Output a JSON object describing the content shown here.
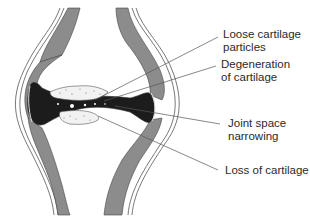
{
  "labels": [
    {
      "id": "loose-particles",
      "text": "Loose cartilage\nparticles",
      "x": 223,
      "y": 28
    },
    {
      "id": "degeneration",
      "text": "Degeneration\nof cartilage",
      "x": 221,
      "y": 58
    },
    {
      "id": "joint-space",
      "text": "Joint space\nnarrowing",
      "x": 228,
      "y": 117
    },
    {
      "id": "loss",
      "text": "Loss of cartilage",
      "x": 225,
      "y": 164
    }
  ],
  "colors": {
    "bone_cortex": "#8c8c8c",
    "outline": "#444444",
    "joint_space": "#1c1c1c",
    "cartilage": "#f2f2f2",
    "leader": "#555555",
    "text": "#2a2a2a"
  }
}
